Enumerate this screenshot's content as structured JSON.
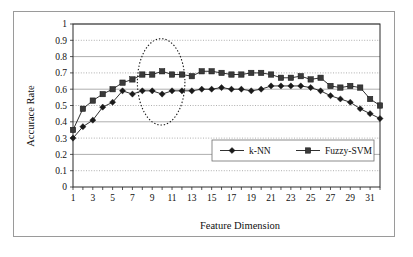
{
  "figure": {
    "border_color": "#9a9a9a",
    "background": "#ffffff"
  },
  "chart_data": {
    "type": "line",
    "title": "",
    "xlabel": "Feature Dimension",
    "ylabel": "Accurace Rate",
    "xlim": [
      1,
      32
    ],
    "ylim": [
      0,
      1
    ],
    "ytick_labels": [
      "0",
      "0.1",
      "0.2",
      "0.3",
      "0.4",
      "0.5",
      "0.6",
      "0.7",
      "0.8",
      "0.9",
      "1"
    ],
    "ytick_values": [
      0,
      0.1,
      0.2,
      0.3,
      0.4,
      0.5,
      0.6,
      0.7,
      0.8,
      0.9,
      1
    ],
    "xtick_labels": [
      "1",
      "3",
      "5",
      "7",
      "9",
      "11",
      "13",
      "15",
      "17",
      "19",
      "21",
      "23",
      "25",
      "27",
      "29",
      "31"
    ],
    "xtick_values": [
      1,
      3,
      5,
      7,
      9,
      11,
      13,
      15,
      17,
      19,
      21,
      23,
      25,
      27,
      29,
      31
    ],
    "grid": true,
    "legend_position": "lower-right",
    "x": [
      1,
      2,
      3,
      4,
      5,
      6,
      7,
      8,
      9,
      10,
      11,
      12,
      13,
      14,
      15,
      16,
      17,
      18,
      19,
      20,
      21,
      22,
      23,
      24,
      25,
      26,
      27,
      28,
      29,
      30,
      31,
      32
    ],
    "series": [
      {
        "name": "k-NN",
        "marker": "diamond",
        "color": "#1a1a1a",
        "values": [
          0.3,
          0.37,
          0.41,
          0.49,
          0.52,
          0.59,
          0.57,
          0.59,
          0.59,
          0.57,
          0.59,
          0.59,
          0.59,
          0.6,
          0.6,
          0.61,
          0.6,
          0.6,
          0.59,
          0.6,
          0.62,
          0.62,
          0.62,
          0.62,
          0.61,
          0.59,
          0.56,
          0.54,
          0.52,
          0.48,
          0.45,
          0.42
        ]
      },
      {
        "name": "Fuzzy-SVM",
        "marker": "square",
        "color": "#3a3a3a",
        "values": [
          0.35,
          0.48,
          0.53,
          0.57,
          0.6,
          0.64,
          0.66,
          0.69,
          0.69,
          0.71,
          0.69,
          0.69,
          0.68,
          0.71,
          0.71,
          0.7,
          0.69,
          0.69,
          0.7,
          0.7,
          0.69,
          0.67,
          0.67,
          0.68,
          0.66,
          0.67,
          0.62,
          0.61,
          0.62,
          0.61,
          0.54,
          0.5
        ]
      }
    ],
    "annotations": [
      {
        "type": "ellipse",
        "style": "dotted",
        "name": "highlight-ellipse",
        "center_x": 9.9,
        "center_y": 0.645,
        "radius_x": 2.4,
        "radius_y": 0.265
      }
    ]
  },
  "legend": {
    "items": [
      {
        "label": "k-NN",
        "marker": "diamond-marker"
      },
      {
        "label": "Fuzzy-SVM",
        "marker": "square-marker"
      }
    ]
  }
}
